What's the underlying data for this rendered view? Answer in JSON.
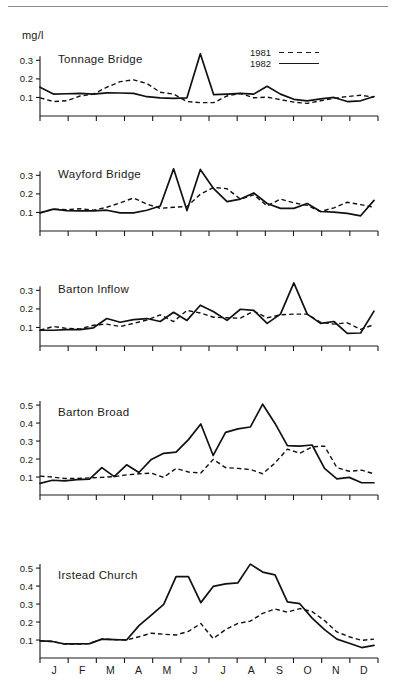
{
  "figure": {
    "unit_label": "mg/l",
    "legend": [
      {
        "label": "1981",
        "style": "dashed"
      },
      {
        "label": "1982",
        "style": "solid"
      }
    ],
    "month_labels": [
      "J",
      "F",
      "M",
      "A",
      "M",
      "J",
      "J",
      "A",
      "S",
      "O",
      "N",
      "D"
    ],
    "ink_color": "#111111",
    "rule_color": "#8a8a8a"
  },
  "chart_data": {
    "type": "line",
    "title": "",
    "xlabel": "",
    "ylabel": "mg/l",
    "grid": false,
    "legend_position": "top-right (panel 1)",
    "x": [
      "J1",
      "J2",
      "F1",
      "F2",
      "M1",
      "M2",
      "A1",
      "A2",
      "M1b",
      "M2b",
      "Jn1",
      "Jn2",
      "Jl1",
      "Jl2",
      "A1b",
      "A2b",
      "S1",
      "S2",
      "O1",
      "O2",
      "N1",
      "N2",
      "D1",
      "D2"
    ],
    "x_tick_labels": [
      "J",
      "F",
      "M",
      "A",
      "M",
      "J",
      "J",
      "A",
      "S",
      "O",
      "N",
      "D"
    ],
    "panels": [
      {
        "name": "Tonnage Bridge",
        "ylim": [
          0.0,
          0.345
        ],
        "yticks": [
          0.1,
          0.2,
          0.3
        ],
        "series": [
          {
            "name": "1981",
            "style": "dashed",
            "values": [
              0.098,
              0.078,
              0.082,
              0.108,
              0.118,
              0.155,
              0.185,
              0.195,
              0.175,
              0.128,
              0.118,
              0.078,
              0.072,
              0.072,
              0.108,
              0.122,
              0.098,
              0.102,
              0.088,
              0.075,
              0.068,
              0.082,
              0.095,
              0.105,
              0.112,
              0.102
            ]
          },
          {
            "name": "1982",
            "style": "solid",
            "values": [
              0.155,
              0.118,
              0.12,
              0.122,
              0.118,
              0.125,
              0.124,
              0.122,
              0.104,
              0.098,
              0.095,
              0.098,
              0.335,
              0.115,
              0.118,
              0.122,
              0.118,
              0.16,
              0.118,
              0.09,
              0.082,
              0.092,
              0.1,
              0.078,
              0.082,
              0.105
            ]
          }
        ]
      },
      {
        "name": "Wayford Bridge",
        "ylim": [
          0.0,
          0.345
        ],
        "yticks": [
          0.1,
          0.2,
          0.3
        ],
        "series": [
          {
            "name": "1981",
            "style": "dashed",
            "values": [
              0.098,
              0.118,
              0.115,
              0.12,
              0.112,
              0.128,
              0.152,
              0.178,
              0.145,
              0.122,
              0.128,
              0.132,
              0.198,
              0.235,
              0.228,
              0.172,
              0.195,
              0.135,
              0.172,
              0.152,
              0.138,
              0.105,
              0.125,
              0.155,
              0.142,
              0.128
            ]
          },
          {
            "name": "1982",
            "style": "solid",
            "values": [
              0.098,
              0.118,
              0.11,
              0.108,
              0.108,
              0.112,
              0.098,
              0.098,
              0.112,
              0.135,
              0.335,
              0.11,
              0.332,
              0.228,
              0.158,
              0.172,
              0.205,
              0.148,
              0.122,
              0.122,
              0.148,
              0.105,
              0.102,
              0.095,
              0.082,
              0.165
            ]
          }
        ]
      },
      {
        "name": "Barton Inflow",
        "ylim": [
          0.0,
          0.345
        ],
        "yticks": [
          0.1,
          0.2,
          0.3
        ],
        "series": [
          {
            "name": "1981",
            "style": "dashed",
            "values": [
              0.085,
              0.105,
              0.095,
              0.092,
              0.112,
              0.118,
              0.105,
              0.122,
              0.14,
              0.168,
              0.132,
              0.192,
              0.178,
              0.155,
              0.152,
              0.15,
              0.188,
              0.152,
              0.168,
              0.172,
              0.172,
              0.128,
              0.118,
              0.125,
              0.09,
              0.115
            ]
          },
          {
            "name": "1982",
            "style": "solid",
            "values": [
              0.085,
              0.085,
              0.088,
              0.088,
              0.098,
              0.148,
              0.128,
              0.142,
              0.148,
              0.132,
              0.182,
              0.138,
              0.22,
              0.185,
              0.138,
              0.198,
              0.192,
              0.122,
              0.172,
              0.34,
              0.172,
              0.122,
              0.132,
              0.068,
              0.07,
              0.188
            ]
          }
        ]
      },
      {
        "name": "Barton Broad",
        "ylim": [
          0.0,
          0.545
        ],
        "yticks": [
          0.1,
          0.2,
          0.3,
          0.4,
          0.5
        ],
        "series": [
          {
            "name": "1981",
            "style": "dashed",
            "values": [
              0.105,
              0.1,
              0.092,
              0.092,
              0.095,
              0.098,
              0.102,
              0.112,
              0.118,
              0.122,
              0.098,
              0.148,
              0.128,
              0.122,
              0.198,
              0.152,
              0.148,
              0.142,
              0.118,
              0.178,
              0.255,
              0.232,
              0.268,
              0.272,
              0.152,
              0.132,
              0.138,
              0.118
            ]
          },
          {
            "name": "1982",
            "style": "solid",
            "values": [
              0.065,
              0.082,
              0.078,
              0.085,
              0.088,
              0.152,
              0.102,
              0.168,
              0.125,
              0.198,
              0.232,
              0.238,
              0.308,
              0.395,
              0.22,
              0.348,
              0.368,
              0.378,
              0.505,
              0.398,
              0.275,
              0.272,
              0.278,
              0.148,
              0.09,
              0.098,
              0.068,
              0.068
            ]
          }
        ]
      },
      {
        "name": "Irstead Church",
        "ylim": [
          0.0,
          0.545
        ],
        "yticks": [
          0.1,
          0.2,
          0.3,
          0.4,
          0.5
        ],
        "series": [
          {
            "name": "1981",
            "style": "dashed",
            "values": [
              0.095,
              0.092,
              0.078,
              0.078,
              0.08,
              0.105,
              0.102,
              0.1,
              0.118,
              0.138,
              0.132,
              0.128,
              0.148,
              0.192,
              0.108,
              0.158,
              0.192,
              0.205,
              0.248,
              0.272,
              0.255,
              0.275,
              0.258,
              0.208,
              0.145,
              0.118,
              0.098,
              0.105
            ]
          },
          {
            "name": "1982",
            "style": "solid",
            "values": [
              0.095,
              0.092,
              0.078,
              0.078,
              0.08,
              0.105,
              0.102,
              0.1,
              0.18,
              0.238,
              0.298,
              0.452,
              0.452,
              0.308,
              0.398,
              0.412,
              0.418,
              0.522,
              0.478,
              0.462,
              0.312,
              0.302,
              0.222,
              0.158,
              0.105,
              0.082,
              0.058,
              0.07
            ]
          }
        ]
      }
    ]
  }
}
